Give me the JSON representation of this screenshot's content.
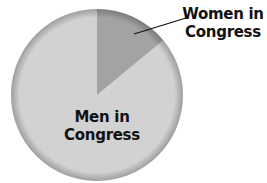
{
  "chart_data": {
    "type": "pie",
    "title": "",
    "categories": [
      "Women in Congress",
      "Men in Congress"
    ],
    "values": [
      14,
      86
    ],
    "units": "percent (estimated from slice angle)",
    "colors": [
      "#a3a3a3",
      "#d2d2d2"
    ],
    "start_angle_deg": 0,
    "direction": "clockwise",
    "labels": {
      "women": [
        "Women in",
        "Congress"
      ],
      "men": [
        "Men in",
        "Congress"
      ]
    },
    "legend": "none (direct labels, Women label uses leader line)"
  },
  "geometry": {
    "cx": 97,
    "cy": 95,
    "r": 86
  }
}
